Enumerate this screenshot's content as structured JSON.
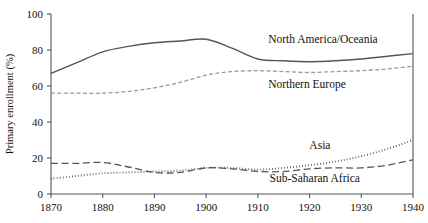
{
  "chart_data": {
    "type": "line",
    "title": "",
    "subtitle": "",
    "xlabel": "",
    "ylabel": "Primary enrollment (%)",
    "xlim": [
      1870,
      1940
    ],
    "ylim": [
      0,
      100
    ],
    "xticks": [
      1870,
      1880,
      1890,
      1900,
      1910,
      1920,
      1930,
      1940
    ],
    "xtick_labels": [
      "1870",
      "1880",
      "1890",
      "1900",
      "1910",
      "1920",
      "1930",
      "1940"
    ],
    "yticks": [
      0,
      20,
      40,
      60,
      80,
      100
    ],
    "ytick_labels": [
      "0",
      "20",
      "40",
      "60",
      "80",
      "100"
    ],
    "grid": false,
    "legend_position": "inline-annotations",
    "x": [
      1870,
      1875,
      1880,
      1885,
      1890,
      1895,
      1900,
      1905,
      1910,
      1915,
      1920,
      1925,
      1930,
      1935,
      1940
    ],
    "series": [
      {
        "name": "North America/Oceania",
        "style": "solid",
        "color": "#555555",
        "width": 1.4,
        "dash": "none",
        "values": [
          67,
          73,
          79,
          82,
          84,
          85,
          86,
          81,
          75,
          74,
          73.5,
          74,
          75,
          76.5,
          78
        ],
        "label_x": 1912,
        "label_y": 84,
        "label_anchor": "start"
      },
      {
        "name": "Northern Europe",
        "style": "short-dash",
        "color": "#9a9a9a",
        "width": 1.3,
        "dash": "4,2.4",
        "values": [
          56,
          56,
          56,
          57,
          59,
          62,
          66,
          68,
          68.5,
          68,
          67.5,
          68,
          68.5,
          69.5,
          71
        ],
        "label_x": 1912,
        "label_y": 59,
        "label_anchor": "start"
      },
      {
        "name": "Asia",
        "style": "dotted",
        "color": "#111111",
        "width": 1.9,
        "dash": "0.6,2.4",
        "values": [
          8.5,
          10,
          11.5,
          12,
          12.5,
          13,
          14.5,
          14.5,
          13.5,
          14.5,
          16,
          18,
          21,
          25,
          30
        ],
        "label_x": 1922,
        "label_y": 25,
        "label_anchor": "middle"
      },
      {
        "name": "Sub-Saharan Africa",
        "style": "long-dash",
        "color": "#555555",
        "width": 1.3,
        "dash": "7,3.6",
        "values": [
          17,
          17,
          17.5,
          15,
          12,
          12,
          14.5,
          14,
          12.5,
          12.5,
          14,
          14.5,
          14.5,
          16,
          19
        ],
        "label_x": 1921,
        "label_y": 6.5,
        "label_anchor": "middle"
      }
    ]
  },
  "plot_geometry": {
    "left": 51,
    "right": 413,
    "top": 14,
    "bottom": 194
  }
}
